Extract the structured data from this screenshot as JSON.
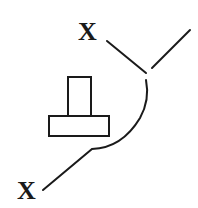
{
  "diagram": {
    "labels": {
      "top": "X",
      "bottom": "X"
    },
    "colors": {
      "ink": "#1a1a1a",
      "background": "#ffffff"
    }
  }
}
